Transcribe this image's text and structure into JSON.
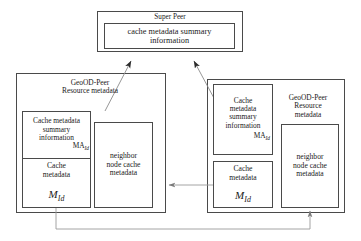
{
  "diagram": {
    "super_peer": {
      "title": "Super Peer",
      "inner_label": "cache metadata summary\ninformation"
    },
    "left_peer": {
      "title": "GeoOD-Peer\nResource metadata",
      "summary_label": "Cache metadata\nsummary\ninformation",
      "summary_symbol": "MA",
      "summary_symbol_sub": "Id",
      "cache_label": "Cache\nmetadata",
      "cache_symbol": "M",
      "cache_symbol_sub": "Id",
      "neighbor_label": "neighbor\nnode cache\nmetadata"
    },
    "right_peer": {
      "title": "GeoOD-Peer\nResource\nmetadata",
      "summary_label": "Cache\nmetadata\nsummary\ninformation",
      "summary_symbol": "MA",
      "summary_symbol_sub": "Id",
      "cache_label": "Cache\nmetadata",
      "cache_symbol": "M",
      "cache_symbol_sub": "Id",
      "neighbor_label": "neighbor\nnode cache\nmetadata"
    },
    "colors": {
      "stroke": "#4a4a4a",
      "connector": "#6b6b6b",
      "background": "#ffffff",
      "text": "#1a1a1a"
    },
    "connectors": [
      {
        "name": "left-peer-to-super-peer",
        "from": "left_peer.summary",
        "to": "super_peer",
        "arrowhead": "to"
      },
      {
        "name": "right-peer-to-super-peer",
        "from": "right_peer.summary",
        "to": "super_peer",
        "arrowhead": "to"
      },
      {
        "name": "right-cache-to-left-peer",
        "from": "right_peer.cache",
        "to": "left_peer",
        "arrowhead": "to"
      },
      {
        "name": "left-cache-to-right-neighbor",
        "from": "left_peer.cache",
        "to": "right_peer.neighbor",
        "arrowhead": "to"
      }
    ]
  }
}
